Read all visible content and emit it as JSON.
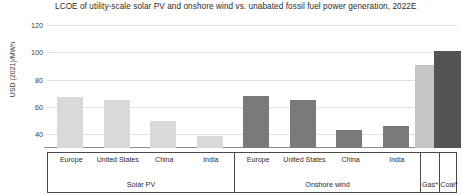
{
  "chart_data": {
    "type": "bar",
    "title": "LCOE of utility-scale solar PV and onshore wind vs. unabated fossil fuel power generation, 2022E",
    "xlabel": "",
    "ylabel": "USD (2021)/MWh",
    "ylim": [
      30,
      125
    ],
    "yticks": [
      40,
      60,
      80,
      100,
      120
    ],
    "grid": true,
    "legend": "none",
    "categories": [
      "Europe",
      "United States",
      "China",
      "India",
      "Europe",
      "United States",
      "China",
      "India",
      "Gas*",
      "Coal*"
    ],
    "values": [
      67,
      65,
      50,
      39,
      68,
      65,
      43,
      46,
      91,
      101
    ],
    "groups": [
      {
        "name": "Solar PV",
        "color": "#d9d9d9",
        "bars": [
          {
            "label": "Europe",
            "value": 67
          },
          {
            "label": "United States",
            "value": 65
          },
          {
            "label": "China",
            "value": 50
          },
          {
            "label": "India",
            "value": 39
          }
        ]
      },
      {
        "name": "Onshore wind",
        "color": "#7a7a7a",
        "bars": [
          {
            "label": "Europe",
            "value": 68
          },
          {
            "label": "United States",
            "value": 65
          },
          {
            "label": "China",
            "value": 43
          },
          {
            "label": "India",
            "value": 46
          }
        ]
      },
      {
        "name": "Gas*",
        "color": "#c5c5c5",
        "bars": [
          {
            "label": "",
            "value": 91
          }
        ]
      },
      {
        "name": "Coal*",
        "color": "#545454",
        "bars": [
          {
            "label": "",
            "value": 101
          }
        ]
      }
    ]
  }
}
